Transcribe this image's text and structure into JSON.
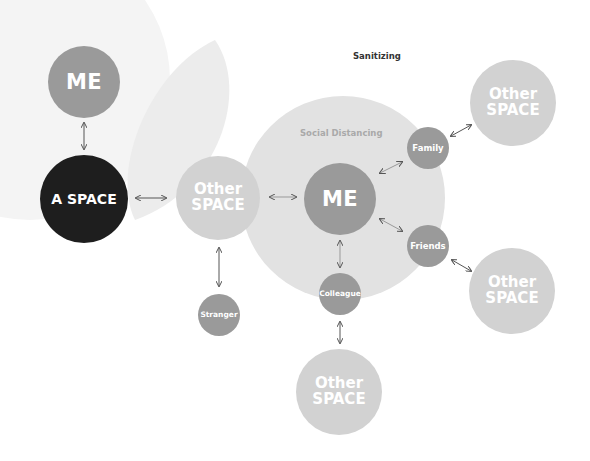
{
  "title": "Sanitizing",
  "zone_label": "Social Distancing",
  "colors": {
    "node_dark": "#9a9a9a",
    "node_light": "#d2d2d2",
    "node_black": "#1e1e1e",
    "zone": "#e2e2e2",
    "leaf": "#f0f0f0",
    "arrow": "#555555"
  },
  "left_group": {
    "me": "ME",
    "a_space": "A SPACE"
  },
  "center": {
    "me": "ME"
  },
  "other_space": {
    "line1": "Other",
    "line2": "SPACE"
  },
  "relations": {
    "family": "Family",
    "friends": "Friends",
    "colleague": "Colleague",
    "stranger": "Stranger"
  }
}
